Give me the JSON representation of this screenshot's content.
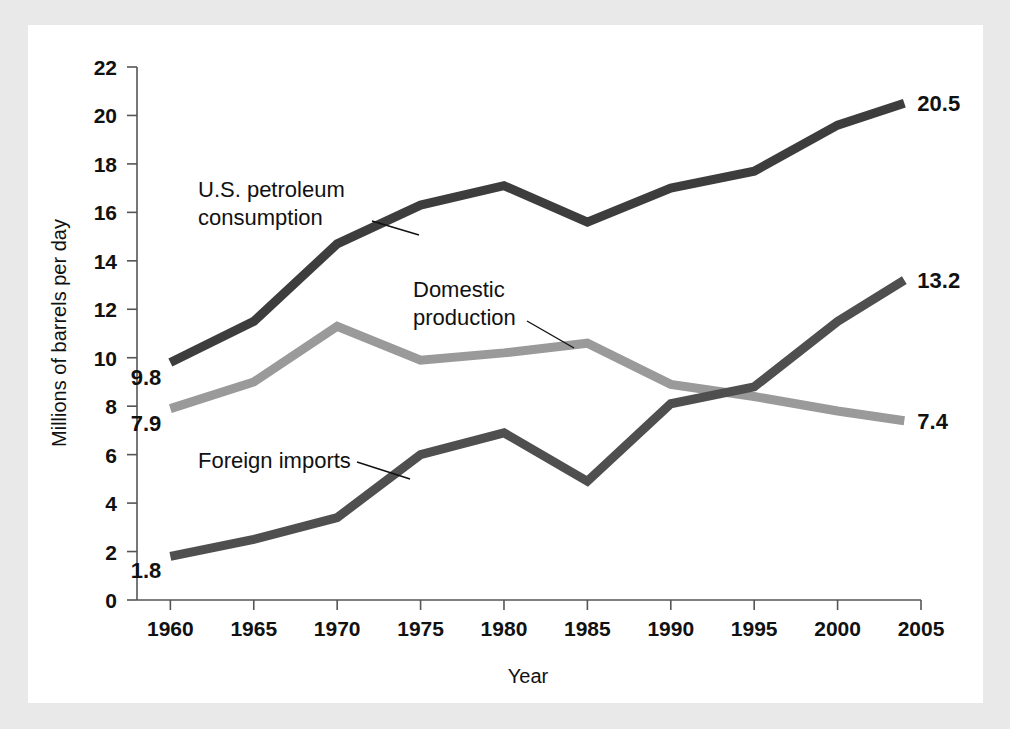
{
  "chart_data": {
    "type": "line",
    "title": "",
    "xlabel": "Year",
    "ylabel": "Millions of barrels per day",
    "x": [
      1960,
      1965,
      1970,
      1975,
      1980,
      1985,
      1990,
      1995,
      2000,
      2004
    ],
    "xtick_labels": [
      "1960",
      "1965",
      "1970",
      "1975",
      "1980",
      "1985",
      "1990",
      "1995",
      "2000",
      "2005"
    ],
    "xtick_values": [
      1960,
      1965,
      1970,
      1975,
      1980,
      1985,
      1990,
      1995,
      2000,
      2005
    ],
    "ytick_labels": [
      "0",
      "2",
      "4",
      "6",
      "8",
      "10",
      "12",
      "14",
      "16",
      "18",
      "20",
      "22"
    ],
    "ytick_values": [
      0,
      2,
      4,
      6,
      8,
      10,
      12,
      14,
      16,
      18,
      20,
      22
    ],
    "xlim": [
      1958,
      2005
    ],
    "ylim": [
      0,
      22
    ],
    "grid": false,
    "legend": "none",
    "series": [
      {
        "name": "U.S. petroleum consumption",
        "color": "#3d3d3d",
        "values": [
          9.8,
          11.5,
          14.7,
          16.3,
          17.1,
          15.6,
          17.0,
          17.7,
          19.6,
          20.5
        ],
        "start_label": "9.8",
        "end_label": "20.5"
      },
      {
        "name": "Domestic production",
        "color": "#9a9a9a",
        "values": [
          7.9,
          9.0,
          11.3,
          9.9,
          10.2,
          10.6,
          8.9,
          8.4,
          7.8,
          7.4
        ],
        "start_label": "7.9",
        "end_label": "7.4"
      },
      {
        "name": "Foreign imports",
        "color": "#4f4f4f",
        "values": [
          1.8,
          2.5,
          3.4,
          6.0,
          6.9,
          4.9,
          8.1,
          8.8,
          11.5,
          13.2
        ],
        "start_label": "1.8",
        "end_label": "13.2"
      }
    ],
    "annotations": [
      {
        "text_line_1": "U.S. petroleum",
        "text_line_2": "consumption",
        "target_series": "U.S. petroleum consumption"
      },
      {
        "text_line_1": "Domestic",
        "text_line_2": "production",
        "target_series": "Domestic production"
      },
      {
        "text_line_1": "Foreign imports",
        "text_line_2": "",
        "target_series": "Foreign imports"
      }
    ]
  },
  "colors": {
    "page_background": "#e9e9e9",
    "panel_background": "#ffffff",
    "axis": "#555555",
    "text": "#111111"
  }
}
